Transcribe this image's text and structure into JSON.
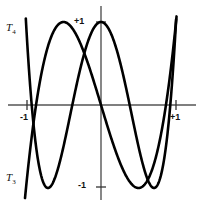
{
  "figure": {
    "background": "#ffffff",
    "stroke_color": "#000000"
  },
  "labels": {
    "y_top": "+1",
    "y_bottom": "-1",
    "x_left": "-1",
    "x_right": "+1",
    "curve_t4": "T",
    "curve_t4_sub": "4",
    "curve_t3": "T",
    "curve_t3_sub": "3"
  },
  "chart_data": {
    "type": "line",
    "title": "",
    "xlabel": "",
    "ylabel": "",
    "xlim": [
      -1.15,
      1.06
    ],
    "ylim": [
      -1.12,
      1.12
    ],
    "grid": false,
    "legend": "inline-curve-labels",
    "xticks": [
      -1,
      1
    ],
    "xticklabels": [
      "-1",
      "+1"
    ],
    "yticks": [
      -1,
      1
    ],
    "yticklabels": [
      "-1",
      "+1"
    ],
    "axes": {
      "x_axis_y": 0,
      "y_axis_x": 0,
      "x_axis_pixel_y": 105,
      "y_axis_pixel_x": 101,
      "x_minus1_pixel": 27,
      "x_plus1_pixel": 176,
      "y_plus1_pixel": 22,
      "y_minus1_pixel": 187
    },
    "series": [
      {
        "name": "T4",
        "label": "T4",
        "formula": "8x^4 - 8x^2 + 1",
        "x": [
          -1.13,
          -1.08,
          -1.03,
          -0.98,
          -0.93,
          -0.88,
          -0.83,
          -0.78,
          -0.73,
          -0.68,
          -0.63,
          -0.58,
          -0.53,
          -0.48,
          -0.43,
          -0.38,
          -0.33,
          -0.28,
          -0.23,
          -0.18,
          -0.13,
          -0.08,
          -0.03,
          0.02,
          0.07,
          0.12,
          0.17,
          0.22,
          0.27,
          0.32,
          0.37,
          0.42,
          0.47,
          0.52,
          0.57,
          0.62,
          0.67,
          0.72,
          0.77,
          0.82,
          0.87,
          0.92,
          0.97,
          1.02,
          1.045
        ],
        "y": [
          3.12,
          2.28,
          1.62,
          1.12,
          0.74,
          0.46,
          0.26,
          0.12,
          0.03,
          -0.02,
          -0.05,
          -0.07,
          -0.08,
          -0.08,
          -0.08,
          -0.08,
          -0.07,
          -0.04,
          0.03,
          0.15,
          0.33,
          0.57,
          0.82,
          1.0,
          0.96,
          0.73,
          0.44,
          0.16,
          -0.07,
          -0.24,
          -0.34,
          -0.4,
          -0.44,
          -0.45,
          -0.44,
          -0.4,
          -0.29,
          -0.06,
          0.34,
          0.98,
          1.93,
          3.27,
          5.08,
          7.46,
          9.09
        ],
        "zeros": [
          -0.9239,
          -0.3827,
          0.3827,
          0.9239
        ],
        "extrema": [
          {
            "x": -0.7071,
            "y": -1.0
          },
          {
            "x": 0.0,
            "y": 1.0
          },
          {
            "x": 0.7071,
            "y": -1.0
          }
        ]
      },
      {
        "name": "T3",
        "label": "T3",
        "formula": "4x^3 - 3x",
        "x": [
          -1.13,
          -1.08,
          -1.03,
          -0.98,
          -0.93,
          -0.88,
          -0.83,
          -0.78,
          -0.73,
          -0.68,
          -0.63,
          -0.58,
          -0.53,
          -0.48,
          -0.43,
          -0.38,
          -0.33,
          -0.28,
          -0.23,
          -0.18,
          -0.13,
          -0.08,
          -0.03,
          0.02,
          0.07,
          0.12,
          0.17,
          0.22,
          0.27,
          0.32,
          0.37,
          0.42,
          0.47,
          0.52,
          0.57,
          0.62,
          0.67,
          0.72,
          0.77,
          0.82,
          0.87,
          0.92,
          0.97,
          1.02,
          1.045
        ],
        "y": [
          -2.38,
          -1.8,
          -1.28,
          -0.82,
          -0.43,
          -0.08,
          0.2,
          0.44,
          0.63,
          0.78,
          0.89,
          0.96,
          1.0,
          1.0,
          0.97,
          0.92,
          0.84,
          0.75,
          0.64,
          0.51,
          0.38,
          0.24,
          0.09,
          -0.06,
          -0.21,
          -0.35,
          -0.48,
          -0.61,
          -0.73,
          -0.83,
          -0.91,
          -0.96,
          -1.0,
          -1.0,
          -0.97,
          -0.91,
          -0.81,
          -0.67,
          -0.49,
          -0.26,
          0.03,
          0.35,
          0.74,
          1.18,
          1.46
        ],
        "zeros": [
          -0.866,
          0.0,
          0.866
        ],
        "extrema": [
          {
            "x": -0.5,
            "y": 1.0
          },
          {
            "x": 0.5,
            "y": -1.0
          }
        ]
      }
    ]
  }
}
